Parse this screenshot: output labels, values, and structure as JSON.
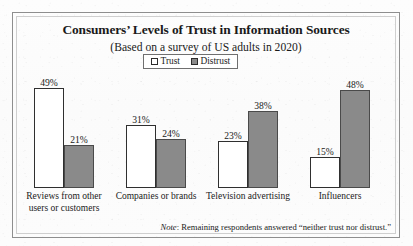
{
  "page": {
    "bleed_artifact": "                       "
  },
  "legend": {
    "items": [
      {
        "label": "Trust",
        "swatch": "white-square-icon",
        "color": "#ffffff"
      },
      {
        "label": "Distrust",
        "swatch": "gray-square-icon",
        "color": "#8a8a8a"
      }
    ]
  },
  "footnote": {
    "lead": "Note",
    "text": ": Remaining respondents answered “neither trust nor distrust.”"
  },
  "chart_data": {
    "type": "bar",
    "title": "Consumers’ Levels of Trust in Information Sources",
    "subtitle": "(Based on a survey of US adults in 2020)",
    "xlabel": "",
    "ylabel": "",
    "ylim": [
      0,
      55
    ],
    "grid": false,
    "legend_position": "top-center",
    "categories": [
      "Reviews from other users or customers",
      "Companies or brands",
      "Television advertising",
      "Influencers"
    ],
    "category_lines": [
      [
        "Reviews from other",
        "users or customers"
      ],
      [
        "Companies or brands"
      ],
      [
        "Television advertising"
      ],
      [
        "Influencers"
      ]
    ],
    "series": [
      {
        "name": "Trust",
        "color": "#ffffff",
        "values": [
          49,
          31,
          23,
          15
        ],
        "labels": [
          "49%",
          "31%",
          "23%",
          "15%"
        ]
      },
      {
        "name": "Distrust",
        "color": "#8a8a8a",
        "values": [
          21,
          24,
          38,
          48
        ],
        "labels": [
          "21%",
          "24%",
          "38%",
          "48%"
        ]
      }
    ],
    "note": "Note: Remaining respondents answered “neither trust nor distrust.”"
  }
}
